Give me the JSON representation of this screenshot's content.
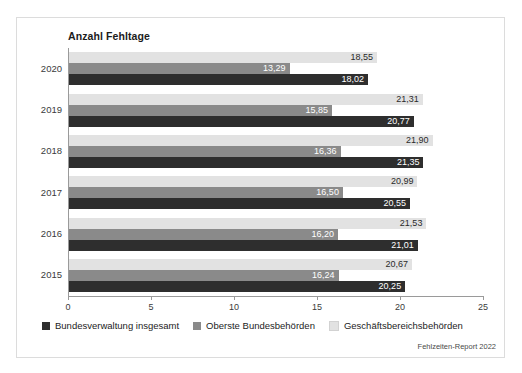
{
  "figure": {
    "title": "Anzahl Fehltage",
    "source_note": "Fehlzeiten-Report 2022",
    "frame_color": "#dcdcdc",
    "background": "#ffffff"
  },
  "legend": {
    "position": "bottom-left",
    "items": [
      {
        "label": "Bundesverwaltung insgesamt",
        "color": "#2e2e2e"
      },
      {
        "label": "Oberste Bundesbehörden",
        "color": "#8a8a8a"
      },
      {
        "label": "Geschäftsbereichsbehörden",
        "color": "#e2e2e2"
      }
    ]
  },
  "chart_data": {
    "type": "bar",
    "orientation": "horizontal",
    "title": "Anzahl Fehltage",
    "xlabel": "",
    "ylabel": "",
    "xlim": [
      0,
      25
    ],
    "xticks": [
      0,
      5,
      10,
      15,
      20,
      25
    ],
    "xtick_labels": [
      "0",
      "5",
      "10",
      "15",
      "20",
      "25"
    ],
    "grid": false,
    "decimal_separator": ",",
    "categories": [
      "2020",
      "2019",
      "2018",
      "2017",
      "2016",
      "2015"
    ],
    "series": [
      {
        "name": "Geschäftsbereichsbehörden",
        "color": "#e2e2e2",
        "values": [
          18.55,
          21.31,
          21.9,
          20.99,
          21.53,
          20.67
        ],
        "labels": [
          "18,55",
          "21,31",
          "21,90",
          "20,99",
          "21,53",
          "20,67"
        ]
      },
      {
        "name": "Oberste Bundesbehörden",
        "color": "#8a8a8a",
        "values": [
          13.29,
          15.85,
          16.36,
          16.5,
          16.2,
          16.24
        ],
        "labels": [
          "13,29",
          "15,85",
          "16,36",
          "16,50",
          "16,20",
          "16,24"
        ]
      },
      {
        "name": "Bundesverwaltung insgesamt",
        "color": "#2e2e2e",
        "values": [
          18.02,
          20.77,
          21.35,
          20.55,
          21.01,
          20.25
        ],
        "labels": [
          "18,02",
          "20,77",
          "21,35",
          "20,55",
          "21,01",
          "20,25"
        ]
      }
    ]
  }
}
